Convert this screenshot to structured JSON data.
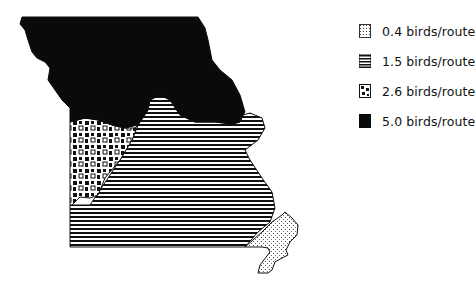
{
  "map": {
    "region": "Missouri",
    "regions": [
      {
        "name": "north",
        "value": "5.0 birds/route",
        "pattern": "solid"
      },
      {
        "name": "west-central",
        "value": "2.6 birds/route",
        "pattern": "blotches"
      },
      {
        "name": "south-central",
        "value": "1.5 birds/route",
        "pattern": "horizontal-lines"
      },
      {
        "name": "southeast",
        "value": "0.4 birds/route",
        "pattern": "stipple"
      }
    ]
  },
  "legend": {
    "items": [
      {
        "label": "0.4 birds/route",
        "pattern": "stipple"
      },
      {
        "label": "1.5 birds/route",
        "pattern": "horizontal-lines"
      },
      {
        "label": "2.6 birds/route",
        "pattern": "blotches"
      },
      {
        "label": "5.0 birds/route",
        "pattern": "solid"
      }
    ]
  },
  "colors": {
    "ink": "#0a0a0a",
    "background": "#ffffff"
  }
}
